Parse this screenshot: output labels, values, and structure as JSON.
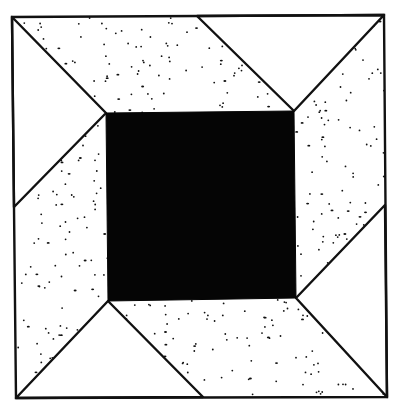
{
  "figure": {
    "title": "Quilt block diagram: central black square framed by four dotted trapezoids and four white corner triangles",
    "colors": {
      "background": "#ffffff",
      "outline": "#111111",
      "center_fill": "#050505",
      "dot_color": "#111111",
      "triangle_fill": "#ffffff"
    },
    "outer_square": {
      "points": [
        [
          12,
          17
        ],
        [
          384,
          15
        ],
        [
          387,
          397
        ],
        [
          16,
          398
        ]
      ]
    },
    "center_square": {
      "points": [
        [
          106,
          113
        ],
        [
          294,
          111
        ],
        [
          296,
          298
        ],
        [
          108,
          301
        ]
      ]
    },
    "edge_points": {
      "top": [
        197,
        16
      ],
      "right": [
        385,
        205
      ],
      "bottom": [
        203,
        397
      ],
      "left": [
        14,
        207
      ]
    },
    "white_triangles": [
      {
        "name": "top-right-triangle",
        "points": [
          [
            197,
            16
          ],
          [
            384,
            15
          ],
          [
            294,
            111
          ]
        ]
      },
      {
        "name": "left-upper-triangle",
        "points": [
          [
            12,
            17
          ],
          [
            106,
            113
          ],
          [
            14,
            207
          ]
        ]
      },
      {
        "name": "bottom-left-triangle",
        "points": [
          [
            108,
            301
          ],
          [
            203,
            397
          ],
          [
            16,
            398
          ]
        ]
      },
      {
        "name": "right-lower-triangle",
        "points": [
          [
            296,
            298
          ],
          [
            385,
            205
          ],
          [
            387,
            397
          ]
        ]
      }
    ],
    "dotted_regions": [
      {
        "name": "top-dotted-region",
        "points": [
          [
            12,
            17
          ],
          [
            197,
            16
          ],
          [
            294,
            111
          ],
          [
            106,
            113
          ]
        ]
      },
      {
        "name": "right-dotted-region",
        "points": [
          [
            384,
            15
          ],
          [
            385,
            205
          ],
          [
            296,
            298
          ],
          [
            294,
            111
          ]
        ]
      },
      {
        "name": "bottom-dotted-region",
        "points": [
          [
            387,
            397
          ],
          [
            203,
            397
          ],
          [
            108,
            301
          ],
          [
            296,
            298
          ]
        ]
      },
      {
        "name": "left-dotted-region",
        "points": [
          [
            16,
            398
          ],
          [
            14,
            207
          ],
          [
            106,
            113
          ],
          [
            108,
            301
          ]
        ]
      }
    ],
    "dot_density": 0.0045
  }
}
